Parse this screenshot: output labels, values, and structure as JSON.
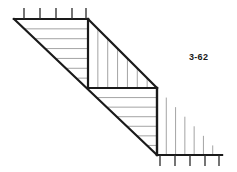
{
  "figure": {
    "label": "3-62",
    "canvas": {
      "width": 237,
      "height": 172
    },
    "background_color": "#ffffff",
    "outline_color": "#1a1a1a",
    "hatch_color": "#9a9a9a",
    "tick_color": "#2a2a2a",
    "outline_width": 2.2,
    "hatch_width": 0.9,
    "tick_width": 1.3
  },
  "chart_data": {
    "type": "diagram",
    "title": "3-62",
    "geometry": {
      "upper_left_vertex": {
        "x": 14,
        "y": 19
      },
      "upper_step_top": {
        "x": 88,
        "y": 19
      },
      "upper_step_bottom": {
        "x": 88,
        "y": 88
      },
      "mid_step_left": {
        "x": 88,
        "y": 88
      },
      "mid_step_right": {
        "x": 157,
        "y": 88
      },
      "lower_step_bottom": {
        "x": 157,
        "y": 155
      },
      "lower_left_vertex": {
        "x": 88,
        "y": 88
      },
      "lower_bottom_corner": {
        "x": 157,
        "y": 155
      },
      "bottom_right_vertex": {
        "x": 222,
        "y": 155
      }
    },
    "regions": [
      {
        "name": "upper-left-triangle",
        "hatch": "horizontal",
        "points": "14,19 88,19 88,88",
        "hatch_lines": 6
      },
      {
        "name": "upper-right-triangle",
        "hatch": "vertical",
        "points": "88,19 157,88 88,88",
        "hatch_lines": 6
      },
      {
        "name": "lower-left-triangle",
        "hatch": "horizontal",
        "points": "88,88 157,88 157,155",
        "hatch_lines": 6
      },
      {
        "name": "lower-right-triangle",
        "hatch": "vertical",
        "points": "157,88 222,155 157,155",
        "hatch_lines": 6
      }
    ],
    "top_ticks": {
      "count": 5,
      "edge_y": 19,
      "x_positions": [
        24,
        40,
        56,
        72,
        86
      ],
      "length": 11,
      "direction": "up"
    },
    "bottom_ticks": {
      "count": 5,
      "edge_y": 155,
      "x_positions": [
        160,
        175,
        190,
        205,
        219
      ],
      "length": 11,
      "direction": "down"
    }
  }
}
